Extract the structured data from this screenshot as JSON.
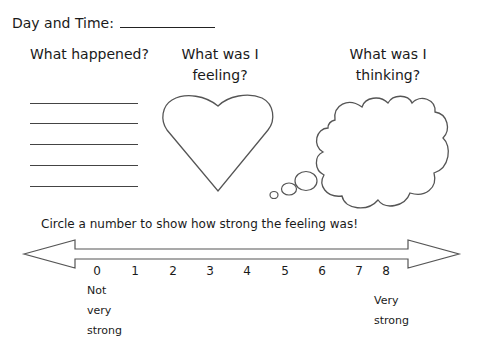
{
  "header": {
    "day_time_label": "Day and Time:"
  },
  "columns": {
    "happened": {
      "title": "What happened?",
      "blank_lines": 5
    },
    "feeling": {
      "title_line1": "What was I",
      "title_line2": "feeling?",
      "shape": "heart-outline"
    },
    "thinking": {
      "title_line1": "What was I",
      "title_line2": "thinking?",
      "shape": "thought-cloud"
    }
  },
  "scale": {
    "instruction": "Circle a number to show how strong the feeling was!",
    "numbers": [
      "0",
      "1",
      "2",
      "3",
      "4",
      "5",
      "6",
      "7",
      "8"
    ],
    "low_label": [
      "Not",
      "very",
      "strong"
    ],
    "high_label": [
      "Very",
      "strong"
    ],
    "shape": "double-headed-arrow"
  },
  "colors": {
    "ink": "#1a1a1a",
    "line": "#444444",
    "background": "#ffffff"
  }
}
